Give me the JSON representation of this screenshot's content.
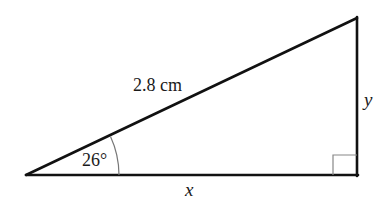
{
  "diagram": {
    "type": "right-triangle",
    "vertices": {
      "bottom_left": [
        26,
        175
      ],
      "bottom_right": [
        357,
        175
      ],
      "top_right": [
        357,
        18
      ]
    },
    "stroke_color": "#111111",
    "arc_color": "#777777",
    "right_angle_box_color": "#888888",
    "labels": {
      "hypotenuse": "2.8 cm",
      "angle": "26°",
      "vertical_side": "y",
      "horizontal_side": "x"
    }
  }
}
